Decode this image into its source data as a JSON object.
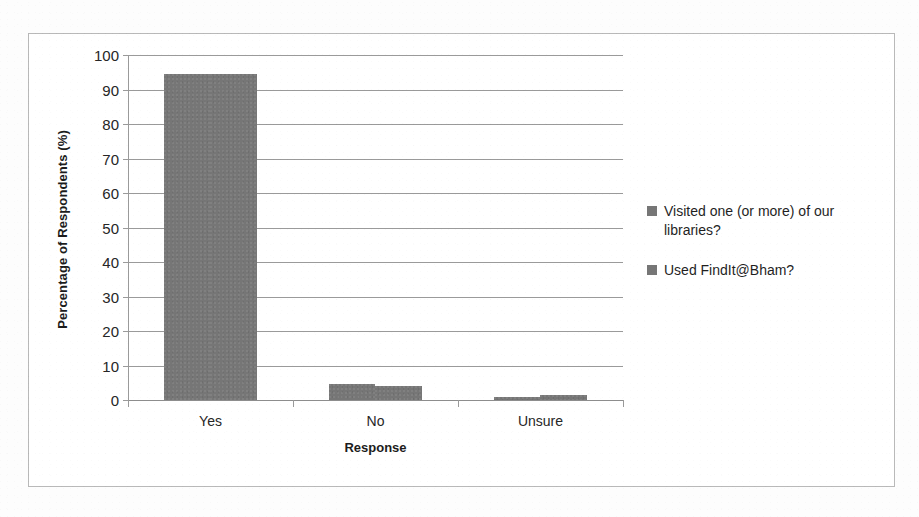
{
  "chart_data": {
    "type": "bar",
    "title": "",
    "xlabel": "Response",
    "ylabel": "Percentage of Respondents (%)",
    "categories": [
      "Yes",
      "No",
      "Unsure"
    ],
    "series": [
      {
        "name": "Visited one (or more) of our libraries?",
        "values": [
          94.5,
          4.5,
          1.0
        ],
        "color": "#767676"
      },
      {
        "name": "Used FindIt@Bham?",
        "values": [
          94.5,
          4.0,
          1.5
        ],
        "color": "#767676"
      }
    ],
    "ylim": [
      0,
      100
    ],
    "y_ticks": [
      0,
      10,
      20,
      30,
      40,
      50,
      60,
      70,
      80,
      90,
      100
    ],
    "y_tick_labels": [
      "0",
      "10",
      "20",
      "30",
      "40",
      "50",
      "60",
      "70",
      "80",
      "90",
      "100"
    ],
    "grid": true,
    "legend_position": "right",
    "plot_background": "#ffffff",
    "gridline_color": "#9a9a9a",
    "frame_border_color": "#b9b9b9"
  },
  "axes": {
    "y_title": "Percentage of Respondents (%)",
    "x_title": "Response",
    "y_labels": [
      "100",
      "90",
      "80",
      "70",
      "60",
      "50",
      "40",
      "30",
      "20",
      "10",
      "0"
    ],
    "x_labels": [
      "Yes",
      "No",
      "Unsure"
    ]
  },
  "legend": {
    "entries": [
      {
        "label": "Visited one (or more) of our libraries?",
        "swatch": "#767676"
      },
      {
        "label": "Used FindIt@Bham?",
        "swatch": "#767676"
      }
    ]
  }
}
